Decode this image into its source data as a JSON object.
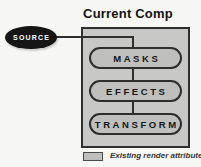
{
  "diagram": {
    "title": "Current Comp",
    "source_node": {
      "label": "SOURCE"
    },
    "pipeline": [
      {
        "label": "MASKS"
      },
      {
        "label": "EFFECTS"
      },
      {
        "label": "TRANSFORM"
      }
    ],
    "legend": {
      "label": "Existing render attributes"
    },
    "colors": {
      "bg": "#f7f7f3",
      "box-fill": "#c8c8c6",
      "pill-fill": "#bfbfbd",
      "line": "#2e2e2c",
      "source-fill": "#161616",
      "source-text": "#ffffff"
    }
  }
}
